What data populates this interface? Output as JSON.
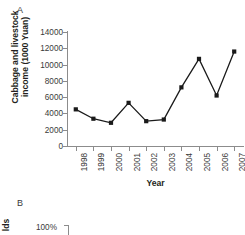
{
  "figure": {
    "panel_a_letter": "A",
    "panel_b_letter": "B"
  },
  "chart_data": {
    "type": "line",
    "title": "",
    "xlabel": "Year",
    "ylabel": "Cabbage and livestock income (1000 Yuan)",
    "ylabel_line1": "Cabbage and livestock",
    "ylabel_line2": "income (1000 Yuan)",
    "categories": [
      "1998",
      "1999",
      "2000",
      "2001",
      "2002",
      "2003",
      "2004",
      "2005",
      "2006",
      "2007"
    ],
    "values": [
      4500,
      3350,
      2850,
      5300,
      3050,
      3250,
      7200,
      10700,
      6200,
      11600
    ],
    "ylim": [
      0,
      14000
    ],
    "yticks": [
      0,
      2000,
      4000,
      6000,
      8000,
      10000,
      12000,
      14000
    ],
    "ytick_labels": [
      "0",
      "2000",
      "4000",
      "6000",
      "8000",
      "10000",
      "12000",
      "14000"
    ],
    "grid": false,
    "legend": null,
    "marker": "square",
    "series_color": "#1a1a1a",
    "axis_color": "#8c8c8c"
  },
  "panel_b": {
    "ylabel_partial": "lds",
    "ytick_label": "100%"
  }
}
